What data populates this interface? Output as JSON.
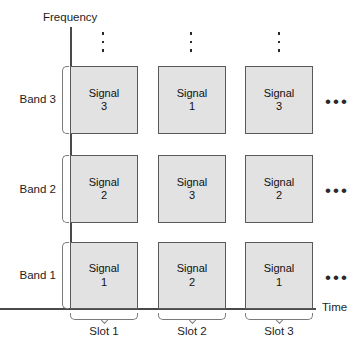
{
  "diagram": {
    "axes": {
      "y_label": "Frequency",
      "x_label": "Time"
    },
    "bands": [
      {
        "label": "Band 3"
      },
      {
        "label": "Band 2"
      },
      {
        "label": "Band 1"
      }
    ],
    "slots": [
      {
        "label": "Slot 1"
      },
      {
        "label": "Slot 2"
      },
      {
        "label": "Slot 3"
      }
    ],
    "cells": [
      {
        "band": "Band 3",
        "slot": "Slot 1",
        "line1": "Signal",
        "line2": "3"
      },
      {
        "band": "Band 3",
        "slot": "Slot 2",
        "line1": "Signal",
        "line2": "1"
      },
      {
        "band": "Band 3",
        "slot": "Slot 3",
        "line1": "Signal",
        "line2": "3"
      },
      {
        "band": "Band 2",
        "slot": "Slot 1",
        "line1": "Signal",
        "line2": "2"
      },
      {
        "band": "Band 2",
        "slot": "Slot 2",
        "line1": "Signal",
        "line2": "3"
      },
      {
        "band": "Band 2",
        "slot": "Slot 3",
        "line1": "Signal",
        "line2": "2"
      },
      {
        "band": "Band 1",
        "slot": "Slot 1",
        "line1": "Signal",
        "line2": "1"
      },
      {
        "band": "Band 1",
        "slot": "Slot 2",
        "line1": "Signal",
        "line2": "2"
      },
      {
        "band": "Band 1",
        "slot": "Slot 3",
        "line1": "Signal",
        "line2": "1"
      }
    ],
    "row_continuation": {
      "band3": "•••",
      "band2": "•••",
      "band1": "•••"
    },
    "column_continuation": {
      "icon": "vertical-ellipsis-icon",
      "count": 3
    },
    "colors": {
      "cell_fill": "#e2e2e2",
      "cell_border": "#5a5a5a",
      "axis": "#4a4a4a",
      "brace": "#7a7a7a",
      "text": "#1d1d1d",
      "background": "#ffffff"
    }
  }
}
